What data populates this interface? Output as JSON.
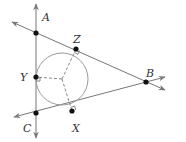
{
  "diagram": {
    "colors": {
      "line": "#777777",
      "circle": "#9a9a9a",
      "dashed": "#8a8a8a",
      "point": "#111111",
      "label": "#333333",
      "background": "#ffffff"
    },
    "points": [
      {
        "id": "A",
        "label": "A",
        "x": 36,
        "y": 33,
        "lx": 42,
        "ly": 18
      },
      {
        "id": "Z",
        "label": "Z",
        "x": 76,
        "y": 49,
        "lx": 73,
        "ly": 40
      },
      {
        "id": "B",
        "label": "B",
        "x": 146,
        "y": 82,
        "lx": 147,
        "ly": 74
      },
      {
        "id": "X",
        "label": "X",
        "x": 72,
        "y": 111,
        "lx": 73,
        "ly": 130
      },
      {
        "id": "C",
        "label": "C",
        "x": 36,
        "y": 113,
        "lx": 23,
        "ly": 129
      },
      {
        "id": "Y",
        "label": "Y",
        "x": 36,
        "y": 77,
        "lx": 21,
        "ly": 81
      }
    ],
    "circle": {
      "cx": 62,
      "cy": 79,
      "r": 26
    },
    "center": {
      "x": 62,
      "y": 79
    },
    "lines": [
      {
        "name": "line-AC",
        "from": [
          36,
          140
        ],
        "to": [
          36,
          5
        ]
      },
      {
        "name": "line-AB",
        "from": [
          12,
          22
        ],
        "to": [
          165,
          90
        ]
      },
      {
        "name": "line-CB",
        "from": [
          14,
          117
        ],
        "to": [
          165,
          77
        ]
      }
    ],
    "radii": [
      {
        "to": "Z"
      },
      {
        "to": "Y"
      },
      {
        "to": "X"
      }
    ],
    "labels": {
      "A": "A",
      "B": "B",
      "C": "C",
      "X": "X",
      "Y": "Y",
      "Z": "Z"
    }
  }
}
